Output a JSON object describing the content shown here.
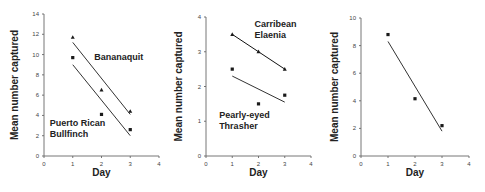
{
  "chart_data": [
    {
      "type": "scatter",
      "title": "",
      "xlabel": "Day",
      "ylabel": "Mean number captured",
      "xlim": [
        0,
        4
      ],
      "ylim": [
        0,
        14
      ],
      "xticks": [
        0,
        1,
        2,
        3,
        4
      ],
      "yticks": [
        0,
        2,
        4,
        6,
        8,
        10,
        12,
        14
      ],
      "grid": false,
      "legend": "inline annotations",
      "series": [
        {
          "name": "Bananaquit",
          "marker": "triangle",
          "x": [
            1,
            2,
            3
          ],
          "y": [
            11.7,
            6.5,
            4.4
          ],
          "fit_line": {
            "x": [
              1,
              3
            ],
            "y": [
              11.2,
              4.1
            ]
          },
          "label_pos": {
            "x": 1.75,
            "y": 9.5
          }
        },
        {
          "name": "Puerto Rican Bullfinch",
          "label_lines": [
            "Puerto Rican",
            "Bullfinch"
          ],
          "marker": "square",
          "x": [
            1,
            2,
            3
          ],
          "y": [
            9.7,
            4.1,
            2.6
          ],
          "fit_line": {
            "x": [
              1,
              3
            ],
            "y": [
              9.0,
              2.0
            ]
          },
          "label_pos": {
            "x": 0.2,
            "y": 3.0
          }
        }
      ]
    },
    {
      "type": "scatter",
      "title": "",
      "xlabel": "Day",
      "ylabel": "Mean number captured",
      "xlim": [
        0,
        4
      ],
      "ylim": [
        0,
        4
      ],
      "xticks": [
        0,
        1,
        2,
        3,
        4
      ],
      "yticks": [
        0,
        1,
        2,
        3,
        4
      ],
      "grid": false,
      "legend": "inline annotations",
      "series": [
        {
          "name": "Carribean Elaenia",
          "label_lines": [
            "Carribean",
            "Elaenia"
          ],
          "marker": "triangle",
          "x": [
            1,
            2,
            3
          ],
          "y": [
            3.5,
            3.0,
            2.5
          ],
          "fit_line": {
            "x": [
              1,
              3
            ],
            "y": [
              3.5,
              2.5
            ],
            "bold": true
          },
          "label_pos": {
            "x": 1.85,
            "y": 3.72
          }
        },
        {
          "name": "Pearly-eyed Thrasher",
          "label_lines": [
            "Pearly-eyed",
            "Thrasher"
          ],
          "marker": "square",
          "x": [
            1,
            2,
            3
          ],
          "y": [
            2.5,
            1.5,
            1.75
          ],
          "fit_line": {
            "x": [
              1,
              3
            ],
            "y": [
              2.3,
              1.55
            ]
          },
          "label_pos": {
            "x": 0.5,
            "y": 1.08
          }
        }
      ]
    },
    {
      "type": "scatter",
      "title": "",
      "xlabel": "Day",
      "ylabel": "Mean number captured",
      "xlim": [
        0,
        4
      ],
      "ylim": [
        0,
        10
      ],
      "xticks": [
        0,
        1,
        2,
        3,
        4
      ],
      "yticks": [
        0,
        2,
        4,
        6,
        8,
        10
      ],
      "grid": false,
      "series": [
        {
          "name": "",
          "marker": "square",
          "x": [
            1,
            2,
            3
          ],
          "y": [
            8.8,
            4.15,
            2.2
          ],
          "fit_line": {
            "x": [
              1,
              3
            ],
            "y": [
              8.3,
              1.8
            ]
          }
        }
      ]
    }
  ],
  "panels": [
    {
      "ylabel": "Mean number captured",
      "xlabel": "Day"
    },
    {
      "ylabel": "Mean number captured",
      "xlabel": "Day"
    },
    {
      "ylabel": "Mean number captured",
      "xlabel": "Day"
    }
  ],
  "colors": {
    "marker": "#1a1a1a",
    "line": "#333333",
    "line_bold": "#111111",
    "axis": "#666666"
  }
}
